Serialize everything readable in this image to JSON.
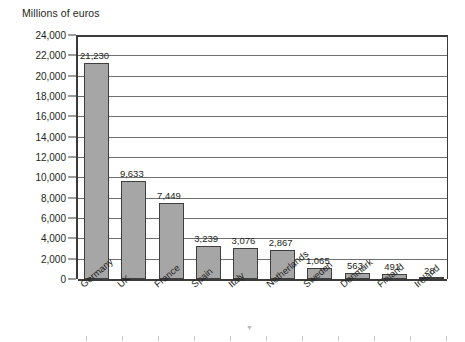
{
  "chart_data": {
    "type": "bar",
    "title": "Millions of euros",
    "xlabel": "",
    "ylabel": "Millions of euros",
    "categories": [
      "Germany",
      "UK",
      "France",
      "Spain",
      "Italy",
      "Netherlands",
      "Sweden",
      "Denmark",
      "Finland",
      "Ireland"
    ],
    "values": [
      21230,
      9633,
      7449,
      3239,
      3076,
      2867,
      1065,
      563,
      491,
      28
    ],
    "value_labels": [
      "21,230",
      "9,633",
      "7,449",
      "3,239",
      "3,076",
      "2,867",
      "1,065",
      "563",
      "491",
      "28"
    ],
    "ylim": [
      0,
      24000
    ],
    "ytick_step": 2000,
    "ytick_labels": [
      "24,000",
      "22,000",
      "20,000",
      "18,000",
      "16,000",
      "14,000",
      "12,000",
      "10,000",
      "8,000",
      "6,000",
      "4,000",
      "2,000",
      "0"
    ],
    "ytick_values": [
      24000,
      22000,
      20000,
      18000,
      16000,
      14000,
      12000,
      10000,
      8000,
      6000,
      4000,
      2000,
      0
    ],
    "grid": true,
    "legend": null,
    "series": [
      {
        "name": "Millions of euros",
        "values": [
          21230,
          9633,
          7449,
          3239,
          3076,
          2867,
          1065,
          563,
          491,
          28
        ]
      }
    ],
    "colors": {
      "bar_fill": "#a6a6a6",
      "bar_border": "#3f3f3f",
      "gridline": "#6f6f6f",
      "axis": "#3b3b3b",
      "text": "#231f20",
      "background": "#ffffff"
    }
  }
}
